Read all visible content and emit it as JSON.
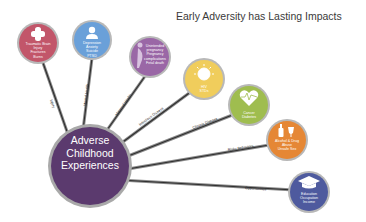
{
  "title": "Early Adversity has Lasting Impacts",
  "hub": {
    "label_lines": [
      "Adverse",
      "Childhood",
      "Experiences"
    ],
    "color": "#5b3a6e"
  },
  "spokes": [
    {
      "label": "Injury",
      "node_lines": [
        "Traumatic Brain",
        "Injury",
        "Fractures",
        "Burns"
      ],
      "icon": "bandage-cross-icon",
      "color": "#c2566a"
    },
    {
      "label": "Mental Health",
      "node_lines": [
        "Depression",
        "Anxiety",
        "Suicide",
        "PTSD"
      ],
      "icon": "person-head-icon",
      "color": "#6aa0d9"
    },
    {
      "label": "Maternal Health",
      "node_lines": [
        "Unintended",
        "pregnancy",
        "Pregnancy",
        "complications",
        "Fetal death"
      ],
      "icon": "pregnant-woman-icon",
      "color": "#9a67a6"
    },
    {
      "label": "Infectious Disease",
      "node_lines": [
        "HIV",
        "STDs"
      ],
      "icon": "virus-icon",
      "color": "#f0cd5c"
    },
    {
      "label": "Chronic Disease",
      "node_lines": [
        "Cancer",
        "Diabetes"
      ],
      "icon": "heart-pulse-icon",
      "color": "#9fbd4f"
    },
    {
      "label": "Risky Behaviors",
      "node_lines": [
        "Alcohol & Drug",
        "Abuse",
        "Unsafe Sex"
      ],
      "icon": "bottle-glass-icon",
      "color": "#e58735"
    },
    {
      "label": "Opportunities",
      "node_lines": [
        "Education",
        "Occupation",
        "Income"
      ],
      "icon": "graduation-cap-icon",
      "color": "#4e5a9e"
    }
  ]
}
